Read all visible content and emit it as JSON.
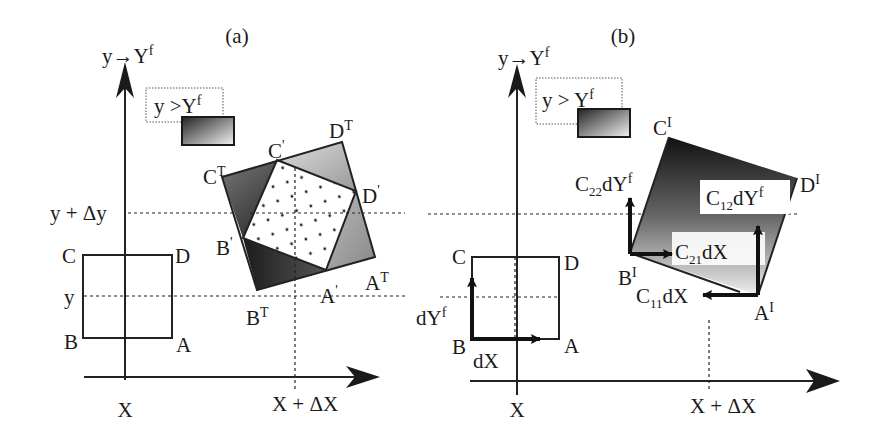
{
  "figure": {
    "panels": [
      {
        "id": "a",
        "caption": "(a)",
        "y_axis_label": {
          "base": "y",
          "arrow": "→",
          "target": "Y",
          "sup": "f"
        },
        "legend": {
          "text": "y >",
          "target": "Y",
          "sup": "f"
        },
        "x_tick": "X",
        "x_tick2": "X + ΔX",
        "y_tick": "y",
        "y_tick2": "y + Δy",
        "square_labels": {
          "A": "A",
          "B": "B",
          "C": "C",
          "D": "D"
        },
        "transformed_labels": {
          "AT": {
            "base": "A",
            "sup": "T"
          },
          "BT": {
            "base": "B",
            "sup": "T"
          },
          "CT": {
            "base": "C",
            "sup": "T"
          },
          "DT": {
            "base": "D",
            "sup": "T"
          },
          "Ap": {
            "base": "A",
            "sup": "'"
          },
          "Bp": {
            "base": "B",
            "sup": "'"
          },
          "Cp": {
            "base": "C",
            "sup": "'"
          },
          "Dp": {
            "base": "D",
            "sup": "'"
          }
        }
      },
      {
        "id": "b",
        "caption": "(b)",
        "y_axis_label": {
          "base": "y",
          "arrow": "→",
          "target": "Y",
          "sup": "f"
        },
        "legend": {
          "text": "y >",
          "target": "Y",
          "sup": "f"
        },
        "x_tick": "X",
        "x_tick2": "X + ΔX",
        "square_labels": {
          "A": "A",
          "B": "B",
          "C": "C",
          "D": "D"
        },
        "basis_vectors": {
          "dYf": {
            "base": "dY",
            "sup": "f"
          },
          "dX": "dX"
        },
        "image_labels": {
          "AI": {
            "base": "A",
            "sup": "I"
          },
          "BI": {
            "base": "B",
            "sup": "I"
          },
          "CI": {
            "base": "C",
            "sup": "I"
          },
          "DI": {
            "base": "D",
            "sup": "I"
          }
        },
        "vector_labels": {
          "C22": {
            "c": "C",
            "sub": "22",
            "rest": "dY",
            "sup": "f"
          },
          "C12": {
            "c": "C",
            "sub": "12",
            "rest": "dY",
            "sup": "f"
          },
          "C21": {
            "c": "C",
            "sub": "21",
            "rest": "dX"
          },
          "C11": {
            "c": "C",
            "sub": "11",
            "rest": "dX"
          }
        }
      }
    ],
    "colors": {
      "ink": "#1a1a1a",
      "dark_fill": "#2a2a2a",
      "mid_fill": "#8a8a8a",
      "light_fill": "#c8c8c8"
    }
  }
}
